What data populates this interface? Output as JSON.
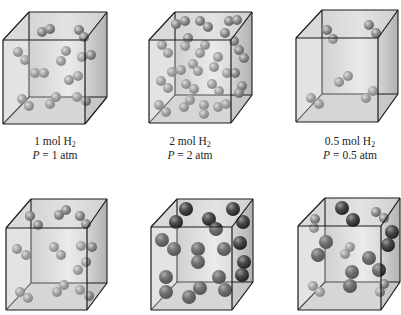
{
  "figure": {
    "colors": {
      "box_edge": "#1a1a1a",
      "box_face_light": "#e8e8e8",
      "box_face_dark": "#b8b8b8",
      "h2_molecule": "#8c8c8c",
      "he_atom_large": "#4a4a4a"
    },
    "panels": [
      {
        "id": "box-1",
        "label_moles": "1 mol H",
        "label_sub": "2",
        "label_pressure_var": "P",
        "label_pressure_val": " = 1 atm",
        "cube": {
          "front": [
            3,
            40,
            85,
            124
          ],
          "back": [
            29,
            12,
            107,
            97
          ]
        },
        "molecules": [
          {
            "x": 42,
            "y": 32,
            "r": 5,
            "t": "s"
          },
          {
            "x": 50,
            "y": 29,
            "r": 5,
            "t": "s"
          },
          {
            "x": 79,
            "y": 30,
            "r": 5,
            "t": "s"
          },
          {
            "x": 84,
            "y": 37,
            "r": 5,
            "t": "s"
          },
          {
            "x": 18,
            "y": 52,
            "r": 5,
            "t": "s"
          },
          {
            "x": 25,
            "y": 60,
            "r": 5,
            "t": "s"
          },
          {
            "x": 66,
            "y": 51,
            "r": 5,
            "t": "s"
          },
          {
            "x": 61,
            "y": 61,
            "r": 5,
            "t": "s"
          },
          {
            "x": 82,
            "y": 57,
            "r": 5,
            "t": "s"
          },
          {
            "x": 91,
            "y": 55,
            "r": 5,
            "t": "s"
          },
          {
            "x": 35,
            "y": 73,
            "r": 5,
            "t": "s"
          },
          {
            "x": 44,
            "y": 73,
            "r": 5,
            "t": "s"
          },
          {
            "x": 69,
            "y": 80,
            "r": 5,
            "t": "s"
          },
          {
            "x": 78,
            "y": 76,
            "r": 5,
            "t": "s"
          },
          {
            "x": 22,
            "y": 99,
            "r": 5,
            "t": "s"
          },
          {
            "x": 29,
            "y": 106,
            "r": 5,
            "t": "s"
          },
          {
            "x": 50,
            "y": 104,
            "r": 5,
            "t": "s"
          },
          {
            "x": 56,
            "y": 97,
            "r": 5,
            "t": "s"
          },
          {
            "x": 77,
            "y": 97,
            "r": 5,
            "t": "s"
          },
          {
            "x": 86,
            "y": 101,
            "r": 5,
            "t": "s"
          }
        ]
      },
      {
        "id": "box-2",
        "label_moles": "2 mol H",
        "label_sub": "2",
        "label_pressure_var": "P",
        "label_pressure_val": " = 2 atm",
        "cube": {
          "front": [
            149,
            40,
            231,
            123
          ],
          "back": [
            175,
            12,
            252,
            95
          ]
        },
        "molecules": [
          {
            "x": 176,
            "y": 24,
            "r": 5,
            "t": "s"
          },
          {
            "x": 185,
            "y": 21,
            "r": 5,
            "t": "s"
          },
          {
            "x": 200,
            "y": 21,
            "r": 5,
            "t": "s"
          },
          {
            "x": 208,
            "y": 27,
            "r": 5,
            "t": "s"
          },
          {
            "x": 229,
            "y": 21,
            "r": 5,
            "t": "s"
          },
          {
            "x": 237,
            "y": 20,
            "r": 5,
            "t": "s"
          },
          {
            "x": 225,
            "y": 33,
            "r": 5,
            "t": "s"
          },
          {
            "x": 234,
            "y": 41,
            "r": 5,
            "t": "s"
          },
          {
            "x": 162,
            "y": 45,
            "r": 5,
            "t": "s"
          },
          {
            "x": 168,
            "y": 53,
            "r": 5,
            "t": "s"
          },
          {
            "x": 185,
            "y": 46,
            "r": 5,
            "t": "s"
          },
          {
            "x": 188,
            "y": 38,
            "r": 5,
            "t": "s"
          },
          {
            "x": 205,
            "y": 45,
            "r": 5,
            "t": "s"
          },
          {
            "x": 200,
            "y": 53,
            "r": 5,
            "t": "s"
          },
          {
            "x": 239,
            "y": 50,
            "r": 5,
            "t": "s"
          },
          {
            "x": 244,
            "y": 58,
            "r": 5,
            "t": "s"
          },
          {
            "x": 218,
            "y": 57,
            "r": 5,
            "t": "s"
          },
          {
            "x": 214,
            "y": 67,
            "r": 5,
            "t": "s"
          },
          {
            "x": 193,
            "y": 64,
            "r": 5,
            "t": "s"
          },
          {
            "x": 198,
            "y": 71,
            "r": 5,
            "t": "s"
          },
          {
            "x": 172,
            "y": 72,
            "r": 5,
            "t": "s"
          },
          {
            "x": 181,
            "y": 70,
            "r": 5,
            "t": "s"
          },
          {
            "x": 227,
            "y": 73,
            "r": 5,
            "t": "s"
          },
          {
            "x": 235,
            "y": 73,
            "r": 5,
            "t": "s"
          },
          {
            "x": 161,
            "y": 81,
            "r": 5,
            "t": "s"
          },
          {
            "x": 168,
            "y": 88,
            "r": 5,
            "t": "s"
          },
          {
            "x": 186,
            "y": 84,
            "r": 5,
            "t": "s"
          },
          {
            "x": 194,
            "y": 89,
            "r": 5,
            "t": "s"
          },
          {
            "x": 212,
            "y": 84,
            "r": 5,
            "t": "s"
          },
          {
            "x": 219,
            "y": 91,
            "r": 5,
            "t": "s"
          },
          {
            "x": 242,
            "y": 86,
            "r": 5,
            "t": "s"
          },
          {
            "x": 239,
            "y": 93,
            "r": 5,
            "t": "s"
          },
          {
            "x": 159,
            "y": 105,
            "r": 5,
            "t": "s"
          },
          {
            "x": 166,
            "y": 112,
            "r": 5,
            "t": "s"
          },
          {
            "x": 184,
            "y": 107,
            "r": 5,
            "t": "s"
          },
          {
            "x": 190,
            "y": 100,
            "r": 5,
            "t": "s"
          },
          {
            "x": 204,
            "y": 105,
            "r": 5,
            "t": "s"
          },
          {
            "x": 204,
            "y": 114,
            "r": 5,
            "t": "s"
          },
          {
            "x": 218,
            "y": 107,
            "r": 5,
            "t": "s"
          },
          {
            "x": 226,
            "y": 104,
            "r": 5,
            "t": "s"
          }
        ]
      },
      {
        "id": "box-3",
        "label_moles": "0.5 mol H",
        "label_sub": "2",
        "label_pressure_var": "P",
        "label_pressure_val": " = 0.5 atm",
        "cube": {
          "front": [
            296,
            38,
            378,
            122
          ],
          "back": [
            322,
            10,
            398,
            94
          ]
        },
        "molecules": [
          {
            "x": 327,
            "y": 30,
            "r": 5,
            "t": "s"
          },
          {
            "x": 333,
            "y": 39,
            "r": 5,
            "t": "s"
          },
          {
            "x": 369,
            "y": 25,
            "r": 5,
            "t": "s"
          },
          {
            "x": 376,
            "y": 33,
            "r": 5,
            "t": "s"
          },
          {
            "x": 339,
            "y": 82,
            "r": 5,
            "t": "s"
          },
          {
            "x": 348,
            "y": 76,
            "r": 5,
            "t": "s"
          },
          {
            "x": 311,
            "y": 98,
            "r": 5,
            "t": "s"
          },
          {
            "x": 319,
            "y": 104,
            "r": 5,
            "t": "s"
          },
          {
            "x": 366,
            "y": 98,
            "r": 5,
            "t": "s"
          },
          {
            "x": 373,
            "y": 91,
            "r": 5,
            "t": "s"
          }
        ]
      },
      {
        "id": "box-4",
        "label_moles": "",
        "cube": {
          "front": [
            6,
            228,
            87,
            310
          ],
          "back": [
            31,
            199,
            107,
            283
          ]
        },
        "molecules": [
          {
            "x": 30,
            "y": 216,
            "r": 5,
            "t": "s"
          },
          {
            "x": 38,
            "y": 225,
            "r": 5,
            "t": "s"
          },
          {
            "x": 59,
            "y": 215,
            "r": 5,
            "t": "s"
          },
          {
            "x": 66,
            "y": 210,
            "r": 5,
            "t": "s"
          },
          {
            "x": 80,
            "y": 216,
            "r": 5,
            "t": "s"
          },
          {
            "x": 86,
            "y": 224,
            "r": 5,
            "t": "s"
          },
          {
            "x": 17,
            "y": 249,
            "r": 5,
            "t": "s"
          },
          {
            "x": 26,
            "y": 255,
            "r": 5,
            "t": "s"
          },
          {
            "x": 54,
            "y": 247,
            "r": 5,
            "t": "s"
          },
          {
            "x": 61,
            "y": 255,
            "r": 5,
            "t": "s"
          },
          {
            "x": 81,
            "y": 246,
            "r": 5,
            "t": "s"
          },
          {
            "x": 92,
            "y": 247,
            "r": 5,
            "t": "s"
          },
          {
            "x": 86,
            "y": 262,
            "r": 5,
            "t": "s"
          },
          {
            "x": 78,
            "y": 270,
            "r": 5,
            "t": "s"
          },
          {
            "x": 20,
            "y": 292,
            "r": 5,
            "t": "s"
          },
          {
            "x": 28,
            "y": 298,
            "r": 5,
            "t": "s"
          },
          {
            "x": 57,
            "y": 292,
            "r": 5,
            "t": "s"
          },
          {
            "x": 64,
            "y": 285,
            "r": 5,
            "t": "s"
          },
          {
            "x": 80,
            "y": 290,
            "r": 5,
            "t": "s"
          },
          {
            "x": 89,
            "y": 296,
            "r": 5,
            "t": "s"
          }
        ]
      },
      {
        "id": "box-5",
        "label_moles": "",
        "cube": {
          "front": [
            151,
            227,
            232,
            310
          ],
          "back": [
            177,
            199,
            253,
            282
          ]
        },
        "molecules": [
          {
            "x": 186,
            "y": 209,
            "r": 7,
            "t": "l"
          },
          {
            "x": 233,
            "y": 209,
            "r": 7,
            "t": "l"
          },
          {
            "x": 176,
            "y": 222,
            "r": 7,
            "t": "l"
          },
          {
            "x": 209,
            "y": 219,
            "r": 7,
            "t": "l"
          },
          {
            "x": 216,
            "y": 229,
            "r": 7,
            "t": "l"
          },
          {
            "x": 243,
            "y": 222,
            "r": 7,
            "t": "l"
          },
          {
            "x": 162,
            "y": 240,
            "r": 7,
            "t": "l"
          },
          {
            "x": 174,
            "y": 249,
            "r": 7,
            "t": "l"
          },
          {
            "x": 198,
            "y": 249,
            "r": 7,
            "t": "l"
          },
          {
            "x": 198,
            "y": 262,
            "r": 7,
            "t": "l"
          },
          {
            "x": 224,
            "y": 249,
            "r": 7,
            "t": "l"
          },
          {
            "x": 240,
            "y": 243,
            "r": 7,
            "t": "l"
          },
          {
            "x": 244,
            "y": 262,
            "r": 7,
            "t": "l"
          },
          {
            "x": 242,
            "y": 275,
            "r": 7,
            "t": "l"
          },
          {
            "x": 166,
            "y": 277,
            "r": 7,
            "t": "l"
          },
          {
            "x": 166,
            "y": 292,
            "r": 7,
            "t": "l"
          },
          {
            "x": 200,
            "y": 288,
            "r": 7,
            "t": "l"
          },
          {
            "x": 189,
            "y": 297,
            "r": 7,
            "t": "l"
          },
          {
            "x": 219,
            "y": 277,
            "r": 7,
            "t": "l"
          },
          {
            "x": 225,
            "y": 290,
            "r": 7,
            "t": "l"
          }
        ]
      },
      {
        "id": "box-6",
        "label_moles": "",
        "cube": {
          "front": [
            298,
            226,
            381,
            310
          ],
          "back": [
            325,
            198,
            400,
            282
          ]
        },
        "molecules": [
          {
            "x": 342,
            "y": 208,
            "r": 7,
            "t": "l"
          },
          {
            "x": 353,
            "y": 220,
            "r": 7,
            "t": "l"
          },
          {
            "x": 376,
            "y": 212,
            "r": 5,
            "t": "s"
          },
          {
            "x": 384,
            "y": 218,
            "r": 5,
            "t": "s"
          },
          {
            "x": 315,
            "y": 219,
            "r": 5,
            "t": "s"
          },
          {
            "x": 314,
            "y": 228,
            "r": 5,
            "t": "s"
          },
          {
            "x": 392,
            "y": 232,
            "r": 7,
            "t": "l"
          },
          {
            "x": 388,
            "y": 245,
            "r": 7,
            "t": "l"
          },
          {
            "x": 326,
            "y": 242,
            "r": 7,
            "t": "l"
          },
          {
            "x": 318,
            "y": 255,
            "r": 7,
            "t": "l"
          },
          {
            "x": 350,
            "y": 247,
            "r": 5,
            "t": "s"
          },
          {
            "x": 345,
            "y": 254,
            "r": 5,
            "t": "s"
          },
          {
            "x": 369,
            "y": 258,
            "r": 7,
            "t": "l"
          },
          {
            "x": 379,
            "y": 270,
            "r": 7,
            "t": "l"
          },
          {
            "x": 352,
            "y": 272,
            "r": 7,
            "t": "l"
          },
          {
            "x": 350,
            "y": 286,
            "r": 7,
            "t": "l"
          },
          {
            "x": 313,
            "y": 286,
            "r": 5,
            "t": "s"
          },
          {
            "x": 320,
            "y": 292,
            "r": 5,
            "t": "s"
          },
          {
            "x": 384,
            "y": 284,
            "r": 5,
            "t": "s"
          },
          {
            "x": 380,
            "y": 292,
            "r": 5,
            "t": "s"
          }
        ]
      }
    ],
    "label_positions": [
      {
        "x": 55,
        "y": 134
      },
      {
        "x": 190,
        "y": 134
      },
      {
        "x": 350,
        "y": 134
      }
    ]
  }
}
